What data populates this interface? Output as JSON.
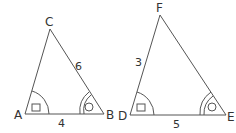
{
  "figure": {
    "stroke_color": "#555555",
    "triangles": [
      {
        "name": "ABC",
        "vertices": {
          "A": "A",
          "B": "B",
          "C": "C"
        },
        "sides": {
          "AB": "4",
          "BC": "6"
        },
        "angle_markers": {
          "A": "single arc with square",
          "B": "double arc with circle"
        }
      },
      {
        "name": "DEF",
        "vertices": {
          "D": "D",
          "E": "E",
          "F": "F"
        },
        "sides": {
          "DF": "3",
          "DE": "5"
        },
        "angle_markers": {
          "D": "single arc with square",
          "E": "double arc with circle"
        }
      }
    ]
  }
}
